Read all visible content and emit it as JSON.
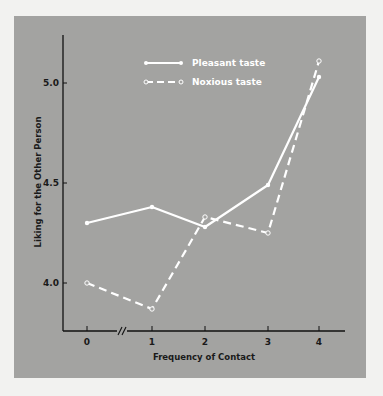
{
  "chart_data": {
    "type": "line",
    "title": "",
    "xlabel": "Frequency of Contact",
    "ylabel": "Liking for the Other Person",
    "categories": [
      "0",
      "1",
      "2",
      "3",
      "4"
    ],
    "x": [
      0,
      1,
      2,
      3,
      4
    ],
    "axis_break": {
      "between": [
        "0",
        "1"
      ],
      "symbol": "//"
    },
    "yticks": [
      "4.0",
      "4.5",
      "5.0"
    ],
    "ytick_values": [
      4.0,
      4.5,
      5.0
    ],
    "ylim": [
      3.76,
      5.24
    ],
    "grid": false,
    "legend_position": "top-center",
    "series": [
      {
        "name": "Pleasant taste",
        "style": "solid",
        "marker": "filled-circle",
        "color": "#ffffff",
        "values": [
          4.3,
          4.38,
          4.28,
          4.49,
          5.03
        ]
      },
      {
        "name": "Noxious taste",
        "style": "dashed",
        "marker": "open-circle",
        "color": "#ffffff",
        "values": [
          4.0,
          3.87,
          4.33,
          4.25,
          5.11
        ]
      }
    ]
  }
}
